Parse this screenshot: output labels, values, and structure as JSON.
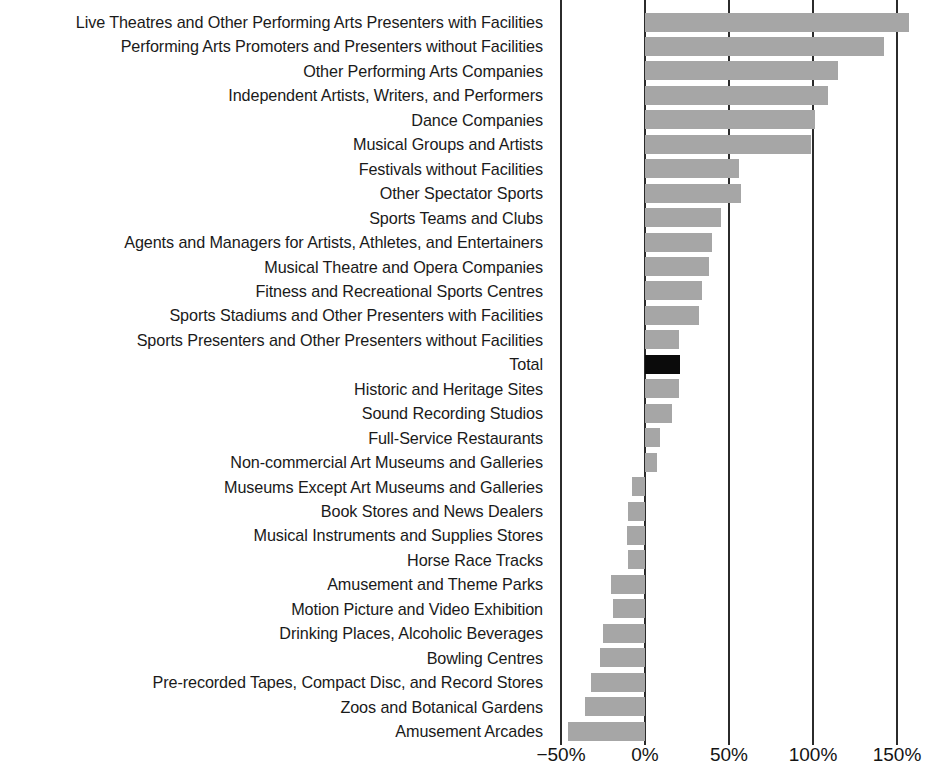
{
  "chart_data": {
    "type": "bar",
    "orientation": "horizontal",
    "title": "",
    "subtitle": "",
    "xlabel": "",
    "ylabel": "",
    "xlim": [
      -57,
      161
    ],
    "grid": true,
    "legend": false,
    "x_tick_labels": [
      "−50%",
      "0%",
      "50%",
      "100%",
      "150%"
    ],
    "x_tick_values": [
      -50,
      0,
      50,
      100,
      150
    ],
    "value_unit": "percent",
    "series_colors": {
      "bar": "#a6a6a6",
      "highlight": "#0b0b0b"
    },
    "highlight_category": "Total",
    "categories": [
      "Live Theatres and Other Performing Arts Presenters with Facilities",
      "Performing Arts Promoters and Presenters without Facilities",
      "Other Performing Arts Companies",
      "Independent Artists, Writers, and Performers",
      "Dance Companies",
      "Musical Groups and Artists",
      "Festivals without Facilities",
      "Other Spectator Sports",
      "Sports Teams and Clubs",
      "Agents and Managers for Artists, Athletes, and Entertainers",
      "Musical Theatre and Opera Companies",
      "Fitness and Recreational Sports Centres",
      "Sports Stadiums and Other Presenters with Facilities",
      "Sports Presenters and Other Presenters without Facilities",
      "Total",
      "Historic and Heritage Sites",
      "Sound Recording Studios",
      "Full-Service Restaurants",
      "Non-commercial Art Museums and Galleries",
      "Museums Except Art Museums and Galleries",
      "Book Stores and News Dealers",
      "Musical Instruments and Supplies Stores",
      "Horse Race Tracks",
      "Amusement and Theme Parks",
      "Motion Picture and Video Exhibition",
      "Drinking Places, Alcoholic Beverages",
      "Bowling Centres",
      "Pre-recorded Tapes, Compact Disc, and Record Stores",
      "Zoos and Botanical Gardens",
      "Amusement Arcades"
    ],
    "values": [
      157,
      142,
      115,
      109,
      101,
      99,
      56,
      57,
      45,
      40,
      38,
      34,
      32,
      20,
      21,
      20,
      16,
      9,
      7,
      -8,
      -10,
      -11,
      -10,
      -20,
      -19,
      -25,
      -27,
      -32,
      -36,
      -46
    ]
  }
}
